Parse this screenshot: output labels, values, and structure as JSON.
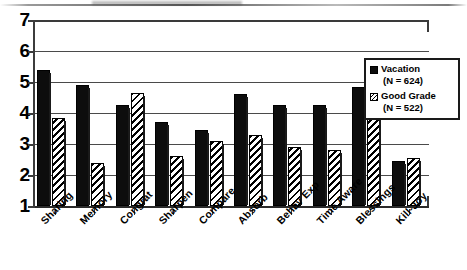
{
  "chart_data": {
    "type": "bar",
    "title": "",
    "subtitle": "",
    "xlabel": "",
    "ylabel": "",
    "ylim": [
      1,
      7
    ],
    "yticks": [
      1,
      2,
      3,
      4,
      5,
      6,
      7
    ],
    "ytick_labels": [
      "1",
      "2",
      "3",
      "4",
      "5",
      "6",
      "7"
    ],
    "grid": true,
    "grid_axis": "y",
    "legend_position": "top-right",
    "categories": [
      "Sharing",
      "Memory",
      "Congrat",
      "Sharpen",
      "Compare",
      "Absorb",
      "Behav Exp",
      "Time Aware",
      "Blessings",
      "Kill-Joy"
    ],
    "series": [
      {
        "name": "Vacation",
        "n_label": "(N = 624)",
        "n": 624,
        "fill": "solid-black",
        "color": "#0d0d0d",
        "values": [
          5.4,
          4.9,
          4.25,
          3.7,
          3.45,
          4.6,
          4.25,
          4.25,
          4.85,
          2.45
        ]
      },
      {
        "name": "Good Grade",
        "n_label": "(N = 522)",
        "n": 522,
        "fill": "diagonal-hatch",
        "color": "#ffffff",
        "values": [
          3.85,
          2.4,
          4.65,
          2.6,
          3.1,
          3.3,
          2.9,
          2.8,
          4.35,
          2.55
        ]
      }
    ]
  },
  "legend": {
    "entries": [
      {
        "label": "Vacation",
        "sublabel": "(N = 624)",
        "swatch": "solid-black-square-icon"
      },
      {
        "label": "Good Grade",
        "sublabel": "(N = 522)",
        "swatch": "hatched-square-icon"
      }
    ]
  }
}
